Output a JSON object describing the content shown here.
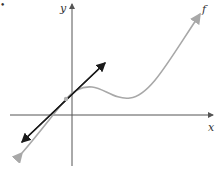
{
  "figure": {
    "marker": "•",
    "axes": {
      "x_label": "x",
      "y_label": "y",
      "color": "#555555"
    },
    "curve": {
      "label": "f",
      "color": "#a8a8a8"
    },
    "tangent_line": {
      "color": "#1a1a1a"
    },
    "tangent_point": {
      "color": "#b0b0b0"
    }
  }
}
